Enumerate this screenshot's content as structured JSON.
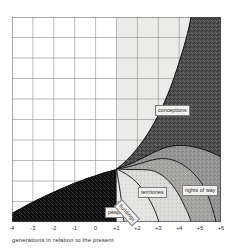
{
  "figure": {
    "name": "generations-zone-diagram",
    "background_color": "#ffffff"
  },
  "axis": {
    "x_caption": "generations in relation to the present",
    "x_ticks": [
      "-4",
      "-3",
      "-2",
      "-1",
      "0",
      "+1",
      "+2",
      "+3",
      "+4",
      "+5",
      "+6"
    ],
    "tick_color": "#2b2b2b",
    "grid_color": "#8d8d8d"
  },
  "regions": {
    "conceptions": {
      "label": "conceptions",
      "fill": "#4a4a4a"
    },
    "territories": {
      "label": "territories",
      "fill": "#9a9a9a"
    },
    "rights_of_way": {
      "label": "rights of way",
      "fill": "#8e8e8e"
    },
    "people": {
      "label": "people",
      "fill": "#d8d8d6"
    },
    "buildings": {
      "label": "buildings",
      "fill": "#bcbcba"
    },
    "past_block": {
      "label": "",
      "fill": "#0d0d0d"
    }
  },
  "chart_data": {
    "type": "area",
    "title": "",
    "xlabel": "generations in relation to the present",
    "ylabel": "",
    "x": [
      -4,
      -3,
      -2,
      -1,
      0,
      1,
      2,
      3,
      4,
      5,
      6
    ],
    "xlim": [
      -4,
      6
    ],
    "ylim": [
      0,
      10
    ],
    "grid": true,
    "legend": "inline-labels",
    "series": [
      {
        "name": "conceptions",
        "values": [
          0,
          0,
          0,
          0,
          0,
          2.6,
          4.4,
          6.1,
          7.6,
          8.9,
          10.0
        ]
      },
      {
        "name": "rights of way",
        "values": [
          0,
          0,
          0,
          0,
          0,
          2.0,
          2.6,
          2.5,
          2.1,
          1.5,
          0.9
        ]
      },
      {
        "name": "territories",
        "values": [
          0,
          0,
          0,
          0,
          0,
          1.6,
          1.9,
          1.7,
          1.3,
          0.8,
          0.35
        ]
      },
      {
        "name": "buildings",
        "values": [
          0,
          0,
          0,
          0,
          0,
          1.15,
          1.25,
          1.0,
          0.65,
          0.35,
          0.12
        ]
      },
      {
        "name": "people",
        "values": [
          0,
          0,
          0,
          0,
          0,
          0.75,
          0.7,
          0.45,
          0.22,
          0.08,
          0.0
        ]
      },
      {
        "name": "past",
        "values": [
          2.6,
          2.0,
          1.45,
          0.85,
          0.0,
          0,
          0,
          0,
          0,
          0,
          0
        ]
      }
    ]
  }
}
